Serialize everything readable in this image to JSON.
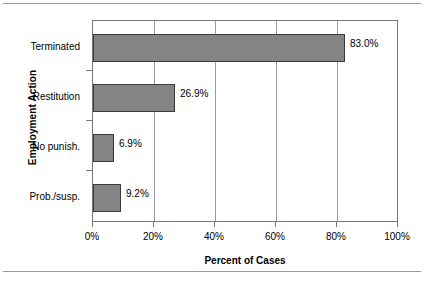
{
  "chart_data": {
    "type": "bar",
    "orientation": "horizontal",
    "title": "",
    "xlabel": "Percent of Cases",
    "ylabel": "Employment Action",
    "categories": [
      "Terminated",
      "Restitution",
      "No punish.",
      "Prob./susp."
    ],
    "values": [
      83.0,
      26.9,
      6.9,
      9.2
    ],
    "data_labels": [
      "83.0%",
      "26.9%",
      "6.9%",
      "9.2%"
    ],
    "xlim": [
      0,
      100
    ],
    "xticks": [
      0,
      20,
      40,
      60,
      80,
      100
    ],
    "xtick_labels": [
      "0%",
      "20%",
      "40%",
      "60%",
      "80%",
      "100%"
    ],
    "grid": "vertical",
    "legend": "none",
    "bar_fill_color": "#848484",
    "bar_border_color": "#3a3a3a",
    "axis_color": "#767676",
    "gridline_color": "#9b9b9b",
    "background_color": "#ffffff"
  }
}
